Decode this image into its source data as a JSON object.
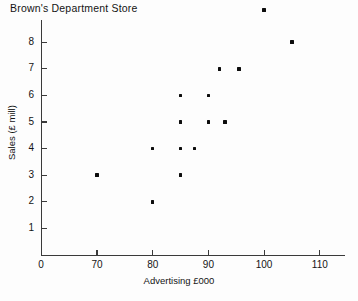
{
  "chart_data": {
    "type": "scatter",
    "title": "Brown's Department Store",
    "xlabel": "Advertising £000",
    "ylabel": "Sales (£ mill)",
    "grid": false,
    "legend": null,
    "axis_break_x": true,
    "xlim": [
      0,
      113
    ],
    "ylim": [
      0,
      9.6
    ],
    "xticks": [
      0,
      70,
      80,
      90,
      100,
      110
    ],
    "xtick_labels": [
      "0",
      "70",
      "80",
      "90",
      "100",
      "110"
    ],
    "yticks": [
      1,
      2,
      3,
      4,
      5,
      6,
      7,
      8
    ],
    "ytick_labels": [
      "1",
      "2",
      "3",
      "4",
      "5",
      "6",
      "7",
      "8"
    ],
    "x": [
      70,
      80,
      80,
      85,
      85,
      85,
      85,
      87.5,
      90,
      90,
      92,
      93,
      95.5,
      100,
      105
    ],
    "y": [
      3,
      4,
      2,
      6,
      5,
      4,
      3,
      4,
      6,
      5,
      7,
      5,
      7,
      9.2,
      8
    ],
    "points": [
      {
        "x": 70,
        "y": 3
      },
      {
        "x": 80,
        "y": 4
      },
      {
        "x": 80,
        "y": 2
      },
      {
        "x": 85,
        "y": 6
      },
      {
        "x": 85,
        "y": 5
      },
      {
        "x": 85,
        "y": 4
      },
      {
        "x": 85,
        "y": 3
      },
      {
        "x": 87.5,
        "y": 4
      },
      {
        "x": 90,
        "y": 6
      },
      {
        "x": 90,
        "y": 5
      },
      {
        "x": 92,
        "y": 7
      },
      {
        "x": 93,
        "y": 5
      },
      {
        "x": 95.5,
        "y": 7
      },
      {
        "x": 100,
        "y": 9.2
      },
      {
        "x": 105,
        "y": 8
      }
    ],
    "marker_color": "#0d0d0d",
    "axis_color": "#3a3a3a",
    "background_color": "#fdfdfd"
  }
}
